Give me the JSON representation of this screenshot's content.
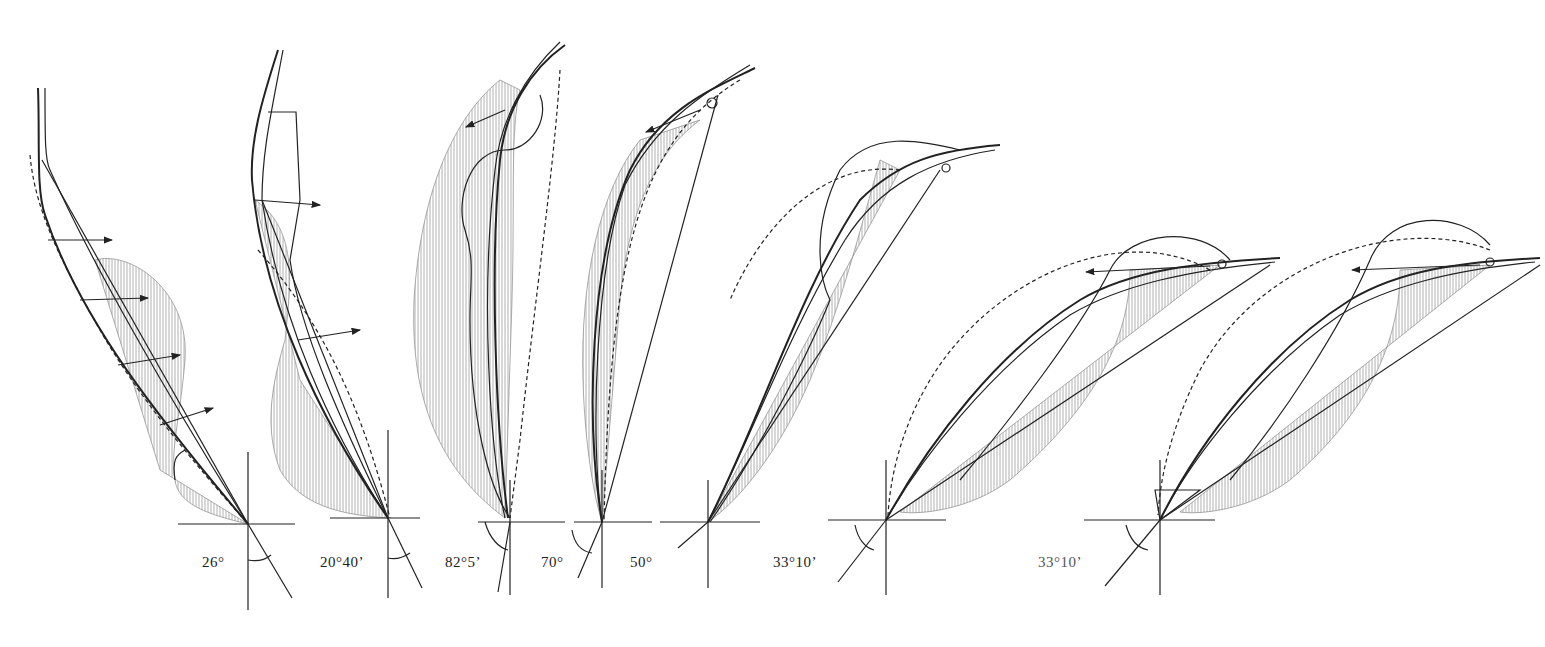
{
  "figure": {
    "colors": {
      "ink": "#222222",
      "hatch": "#9a9a9a",
      "dashed": "#777777",
      "background": "#ffffff"
    },
    "panels": [
      {
        "id": 1,
        "angle_label": "26°",
        "origin": [
          248,
          524
        ],
        "label_pos": [
          202,
          552
        ]
      },
      {
        "id": 2,
        "angle_label": "20°40’",
        "origin": [
          388,
          518
        ],
        "label_pos": [
          320,
          552
        ]
      },
      {
        "id": 3,
        "angle_label": "82°5’",
        "origin": [
          510,
          518
        ],
        "label_pos": [
          445,
          552
        ]
      },
      {
        "id": 4,
        "angle_label": "70°",
        "origin": [
          602,
          522
        ],
        "label_pos": [
          541,
          552
        ]
      },
      {
        "id": 5,
        "angle_label": "50°",
        "origin": [
          708,
          522
        ],
        "label_pos": [
          630,
          552
        ]
      },
      {
        "id": 6,
        "angle_label": "33°10’",
        "origin": [
          886,
          520
        ],
        "label_pos": [
          773,
          552
        ]
      },
      {
        "id": 7,
        "angle_label": "33°10’",
        "origin": [
          1160,
          520
        ],
        "label_pos": [
          1038,
          552
        ]
      }
    ]
  }
}
